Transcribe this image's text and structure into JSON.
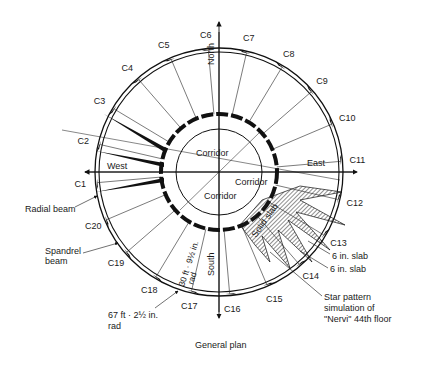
{
  "diagram": {
    "caption": "General plan",
    "directions": {
      "north": "North",
      "south": "South",
      "east": "East",
      "west": "West"
    },
    "corridors": [
      "Corridor",
      "Corridor",
      "Corridor"
    ],
    "columns": [
      "C1",
      "C2",
      "C3",
      "C4",
      "C5",
      "C6",
      "C7",
      "C8",
      "C9",
      "C10",
      "C11",
      "C12",
      "C13",
      "C14",
      "C15",
      "C16",
      "C17",
      "C18",
      "C19",
      "C20"
    ],
    "annotations": {
      "radial_beam": "Radial beam",
      "spandrel_beam_1": "Spandrel",
      "spandrel_beam_2": "beam",
      "outer_radius_1": "67 ft · 2½ in.",
      "outer_radius_2": "rad",
      "inner_radius_1": "30 ft · 9½ in.",
      "inner_radius_2": "rad",
      "solid_slab": "Solid slab",
      "slab_1": "6 in. slab",
      "slab_2": "6 in. slab",
      "star_1": "Star pattern",
      "star_2": "simulation of",
      "star_3": "\"Nervi\" 44th floor"
    }
  }
}
